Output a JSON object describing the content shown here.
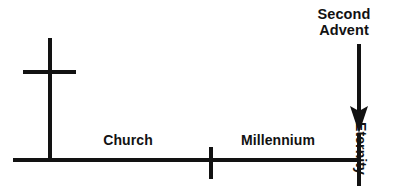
{
  "diagram": {
    "type": "timeline",
    "background_color": "#ffffff",
    "stroke_color": "#121212",
    "labels": {
      "second_advent_line1": "Second",
      "second_advent_line2": "Advent",
      "church": "Church",
      "millennium": "Millennium",
      "eternity": "Eternity"
    },
    "axis": {
      "baseline_y": 160,
      "x_start": 13,
      "x_end": 361,
      "stroke_width": 4
    },
    "markers": [
      {
        "name": "cross",
        "x": 50,
        "top": 38,
        "bottom": 162,
        "crossbar_y": 72,
        "crossbar_x1": 23,
        "crossbar_x2": 76,
        "stroke_width": 4
      },
      {
        "name": "millennium-start-tick",
        "x": 211,
        "top": 147,
        "bottom": 179,
        "stroke_width": 4
      },
      {
        "name": "eternity-start-tick",
        "x": 359,
        "top": 133,
        "bottom": 186,
        "stroke_width": 4
      }
    ],
    "arrow": {
      "name": "second-advent-arrow",
      "x": 359,
      "y_start": 44,
      "y_tip": 132,
      "shaft_width": 4,
      "head_width": 16,
      "head_length": 24
    },
    "segments": [
      {
        "label": "Church",
        "from_x": 50,
        "to_x": 211
      },
      {
        "label": "Millennium",
        "from_x": 211,
        "to_x": 359
      },
      {
        "label": "Eternity",
        "from_x": 359,
        "to_x": 407
      }
    ]
  }
}
